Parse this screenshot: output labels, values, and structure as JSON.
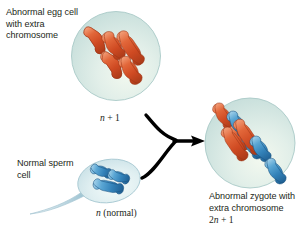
{
  "figure": {
    "background_color": "#ffffff",
    "text_color": "#231f20"
  },
  "labels": {
    "egg_caption": "Abnormal egg cell with extra chromosome",
    "egg_ploidy_symbol": "n",
    "egg_ploidy_suffix": " + 1",
    "sperm_caption": "Normal sperm cell",
    "sperm_ploidy_symbol": "n",
    "sperm_ploidy_suffix": " (normal)",
    "zygote_caption": "Abnormal zygote with extra chromosome",
    "zygote_ploidy_prefix": "2",
    "zygote_ploidy_symbol": "n",
    "zygote_ploidy_suffix": " + 1"
  },
  "colors": {
    "maternal_chromosome": "#d4542b",
    "maternal_chromosome_dark": "#a93a18",
    "maternal_chromosome_light": "#f08a5d",
    "paternal_chromosome": "#3c8fc4",
    "paternal_chromosome_dark": "#1f5f92",
    "paternal_chromosome_light": "#8cc4e4",
    "cell_fill": "#cfe4e0",
    "cell_fill_light": "#eef6f0",
    "cell_edge": "#a9c9c7",
    "sperm_fill": "#dbeaef",
    "arrow": "#000000"
  },
  "cells": [
    {
      "name": "abnormal-egg-cell",
      "shape": "circle",
      "cx": 116,
      "cy": 56,
      "r": 44,
      "chromosome_count": 3,
      "chromosome_color_role": "maternal",
      "ploidy": "n + 1"
    },
    {
      "name": "normal-sperm-cell",
      "shape": "ellipse",
      "cx": 109,
      "cy": 181,
      "rx": 31,
      "ry": 21,
      "chromosome_count": 2,
      "chromosome_color_role": "paternal",
      "ploidy": "n (normal)"
    },
    {
      "name": "abnormal-zygote-cell",
      "shape": "circle",
      "cx": 250,
      "cy": 143,
      "r": 45,
      "chromosome_count": 5,
      "maternal_chromosomes": 3,
      "paternal_chromosomes": 2,
      "ploidy": "2n + 1"
    }
  ],
  "arrows": [
    {
      "name": "egg-to-zygote-arrow",
      "from": "abnormal-egg-cell",
      "to": "fertilization-junction"
    },
    {
      "name": "sperm-to-zygote-arrow",
      "from": "normal-sperm-cell",
      "to": "fertilization-junction"
    },
    {
      "name": "fertilization-arrow",
      "from": "fertilization-junction",
      "to": "abnormal-zygote-cell"
    }
  ]
}
